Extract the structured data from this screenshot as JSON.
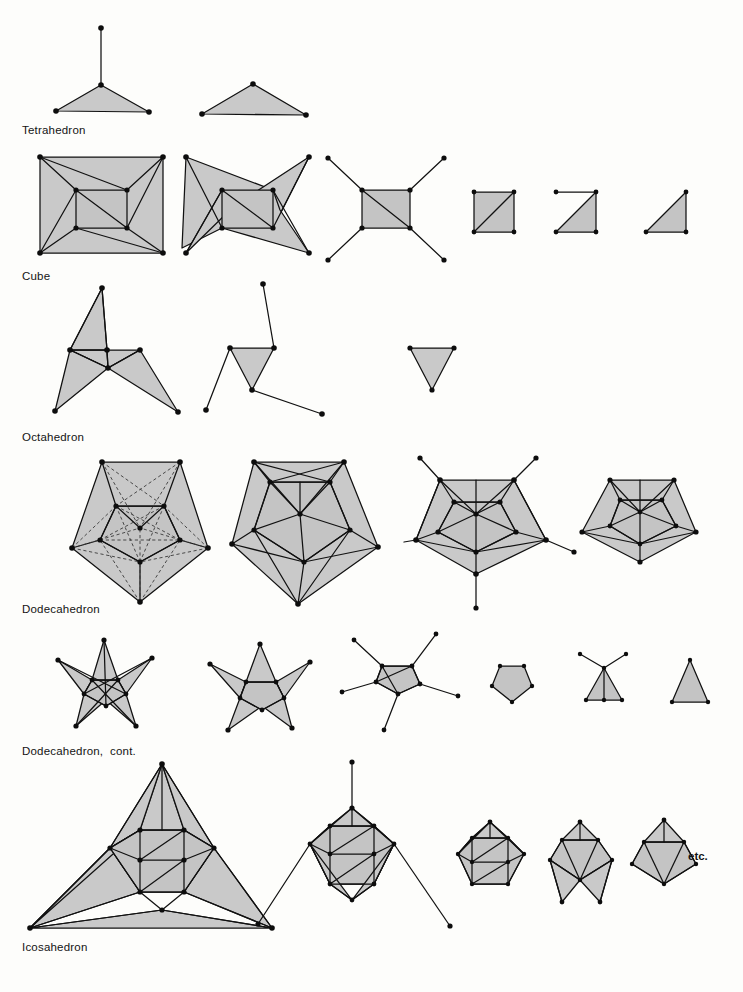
{
  "page": {
    "width": 743,
    "height": 992,
    "background_color": "#fdfdfb",
    "ink_color": "#111111",
    "face_fill_color": "#c9c9c9",
    "kind": "figure-plate"
  },
  "labels": {
    "tetrahedron": "Tetrahedron",
    "cube": "Cube",
    "octahedron": "Octahedron",
    "dodecahedron": "Dodecahedron",
    "dodecahedron_cont": "Dodecahedron,  cont.",
    "icosahedron": "Icosahedron",
    "etc": "etc."
  },
  "rows": [
    {
      "name": "tetrahedron",
      "label": "Tetrahedron",
      "label_x": 22,
      "label_y": 124,
      "stage_count": 2,
      "stages": [
        {
          "name": "tetrahedron-stage-1",
          "x": 40,
          "y": 14,
          "w": 175,
          "h": 110
        },
        {
          "name": "tetrahedron-stage-2",
          "x": 195,
          "y": 62,
          "w": 130,
          "h": 62
        }
      ]
    },
    {
      "name": "cube",
      "label": "Cube",
      "label_x": 22,
      "label_y": 270,
      "stage_count": 6,
      "stages": [
        {
          "name": "cube-stage-1",
          "x": 32,
          "y": 150,
          "w": 140,
          "h": 112
        },
        {
          "name": "cube-stage-2",
          "x": 176,
          "y": 150,
          "w": 140,
          "h": 112
        },
        {
          "name": "cube-stage-3",
          "x": 322,
          "y": 150,
          "w": 130,
          "h": 112
        },
        {
          "name": "cube-stage-4",
          "x": 468,
          "y": 186,
          "w": 52,
          "h": 52
        },
        {
          "name": "cube-stage-5",
          "x": 550,
          "y": 186,
          "w": 52,
          "h": 52
        },
        {
          "name": "cube-stage-6",
          "x": 640,
          "y": 186,
          "w": 52,
          "h": 52
        }
      ]
    },
    {
      "name": "octahedron",
      "label": "Octahedron",
      "label_x": 22,
      "label_y": 431,
      "stage_count": 3,
      "stages": [
        {
          "name": "octahedron-stage-1",
          "x": 55,
          "y": 282,
          "w": 160,
          "h": 135
        },
        {
          "name": "octahedron-stage-2",
          "x": 205,
          "y": 282,
          "w": 140,
          "h": 135
        },
        {
          "name": "octahedron-stage-3",
          "x": 406,
          "y": 342,
          "w": 52,
          "h": 48
        }
      ]
    },
    {
      "name": "dodecahedron",
      "label": "Dodecahedron",
      "label_x": 22,
      "label_y": 603,
      "stage_count": 4,
      "stages": [
        {
          "name": "dodecahedron-stage-1",
          "x": 30,
          "y": 455,
          "w": 190,
          "h": 155
        },
        {
          "name": "dodecahedron-stage-2",
          "x": 228,
          "y": 455,
          "w": 170,
          "h": 155
        },
        {
          "name": "dodecahedron-stage-3",
          "x": 408,
          "y": 455,
          "w": 165,
          "h": 155
        },
        {
          "name": "dodecahedron-stage-4",
          "x": 570,
          "y": 468,
          "w": 135,
          "h": 110
        }
      ]
    },
    {
      "name": "dodecahedron-cont",
      "label": "Dodecahedron,  cont.",
      "label_x": 22,
      "label_y": 745,
      "stage_count": 6,
      "stages": [
        {
          "name": "dodecahedron-cont-stage-1",
          "x": 45,
          "y": 632,
          "w": 130,
          "h": 105
        },
        {
          "name": "dodecahedron-cont-stage-2",
          "x": 205,
          "y": 640,
          "w": 120,
          "h": 95
        },
        {
          "name": "dodecahedron-cont-stage-3",
          "x": 345,
          "y": 632,
          "w": 130,
          "h": 105
        },
        {
          "name": "dodecahedron-cont-stage-4",
          "x": 488,
          "y": 663,
          "w": 45,
          "h": 42
        },
        {
          "name": "dodecahedron-cont-stage-5",
          "x": 578,
          "y": 655,
          "w": 50,
          "h": 52
        },
        {
          "name": "dodecahedron-cont-stage-6",
          "x": 668,
          "y": 655,
          "w": 42,
          "h": 48
        }
      ]
    },
    {
      "name": "icosahedron",
      "label": "Icosahedron",
      "label_x": 22,
      "label_y": 941,
      "stage_count": 5,
      "stages": [
        {
          "name": "icosahedron-stage-1",
          "x": 28,
          "y": 768,
          "w": 250,
          "h": 160
        },
        {
          "name": "icosahedron-stage-2",
          "x": 252,
          "y": 762,
          "w": 215,
          "h": 170
        },
        {
          "name": "icosahedron-stage-3",
          "x": 455,
          "y": 815,
          "w": 90,
          "h": 85
        },
        {
          "name": "icosahedron-stage-4",
          "x": 540,
          "y": 815,
          "w": 90,
          "h": 90
        },
        {
          "name": "icosahedron-stage-5",
          "x": 625,
          "y": 815,
          "w": 80,
          "h": 80
        }
      ]
    }
  ],
  "annotations": [
    {
      "name": "etc-annotation",
      "text": "etc.",
      "x": 688,
      "y": 850
    }
  ],
  "legend": {
    "solid_edge": "solid line = polyhedron edge",
    "dashed_edge": "dashed line = face diagonal / triangulation",
    "vertex_dot": "filled dot = vertex"
  }
}
